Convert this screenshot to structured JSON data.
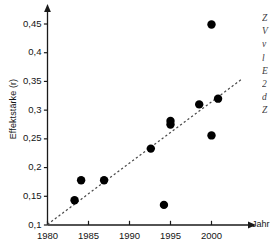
{
  "chart_data": {
    "type": "scatter",
    "title": "",
    "xlabel": "Jahr",
    "ylabel": "Effektstärke (r)",
    "xlim": [
      1980,
      2004
    ],
    "ylim": [
      0.1,
      0.47
    ],
    "grid": false,
    "legend": null,
    "x_ticks": [
      1980,
      1985,
      1990,
      1995,
      2000
    ],
    "x_tick_labels": [
      "1980",
      "1985",
      "1990",
      "1995",
      "2000"
    ],
    "y_ticks": [
      0.1,
      0.15,
      0.2,
      0.25,
      0.3,
      0.35,
      0.4,
      0.45
    ],
    "y_tick_labels": [
      "0,1",
      "0,15",
      "0,2",
      "0,25",
      "0,3",
      "0,35",
      "0,4",
      "0,45"
    ],
    "points": [
      {
        "x": 1983.3,
        "y": 0.143
      },
      {
        "x": 1984.1,
        "y": 0.178
      },
      {
        "x": 1986.9,
        "y": 0.178
      },
      {
        "x": 1992.6,
        "y": 0.233
      },
      {
        "x": 1994.2,
        "y": 0.135
      },
      {
        "x": 1995.0,
        "y": 0.275
      },
      {
        "x": 1995.0,
        "y": 0.281
      },
      {
        "x": 1998.5,
        "y": 0.31
      },
      {
        "x": 2000.0,
        "y": 0.449
      },
      {
        "x": 2000.0,
        "y": 0.256
      },
      {
        "x": 2000.8,
        "y": 0.32
      }
    ],
    "trendline": {
      "style": "dashed",
      "x_start": 1980.0,
      "y_start": 0.101,
      "x_end": 2003.6,
      "y_end": 0.353
    },
    "marker_color": "#000000",
    "axis_color": "#1a1a1a",
    "trendline_color": "#4a4a4a"
  },
  "side_text_fragments": [
    "Z",
    "V",
    "v",
    "l",
    "E",
    "2",
    "d",
    "Z"
  ]
}
